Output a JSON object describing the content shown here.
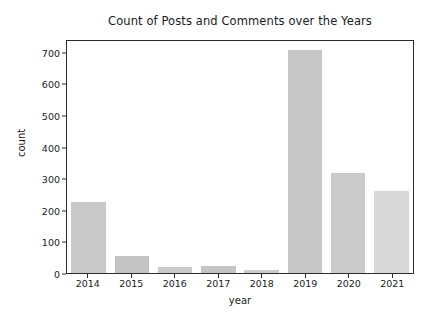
{
  "chart_data": {
    "type": "bar",
    "title": "Count of Posts and Comments over the Years",
    "xlabel": "year",
    "ylabel": "count",
    "categories": [
      "2014",
      "2015",
      "2016",
      "2017",
      "2018",
      "2019",
      "2020",
      "2021"
    ],
    "values": [
      224,
      55,
      20,
      22,
      10,
      705,
      316,
      258
    ],
    "ylim": [
      0,
      740
    ],
    "yticks": [
      0,
      100,
      200,
      300,
      400,
      500,
      600,
      700
    ],
    "ytick_labels": [
      "0",
      "100",
      "200",
      "300",
      "400",
      "500",
      "600",
      "700"
    ],
    "xtick_labels": [
      "2014",
      "2015",
      "2016",
      "2017",
      "2018",
      "2019",
      "2020",
      "2021"
    ],
    "grid": false,
    "legend": null,
    "bar_color": "#c9c9c9",
    "bar_colors": [
      "#c9c9c9",
      "#c4c4c4",
      "#c9c9c9",
      "#c4c4c4",
      "#cccccc",
      "#c7c7c7",
      "#cbcbcb",
      "#d8d8d8"
    ],
    "axes_color": "#2b2b2b",
    "background_color": "#ffffff"
  }
}
